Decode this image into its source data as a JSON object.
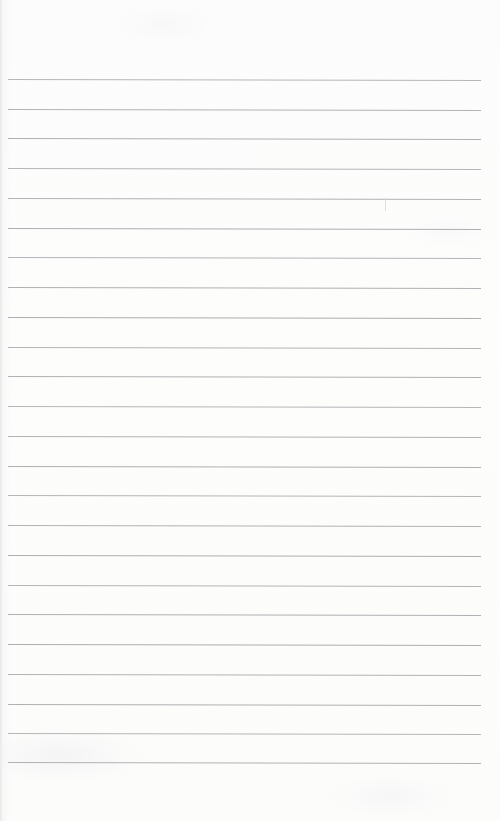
{
  "document": {
    "type": "scanned-lined-paper",
    "title": "Blank lined notepad page",
    "page_width": 500,
    "page_height": 821,
    "background_color": "#fdfdfc",
    "has_text_content": false,
    "text_content": "",
    "ruling": {
      "line_color": "#a9a9ad",
      "line_thickness_px": 1,
      "line_count": 24,
      "first_line_y": 79,
      "line_spacing_px": 29.7,
      "left_x": 8,
      "right_x": 481,
      "slope_deg": 0.12,
      "y_positions": [
        79,
        109,
        138,
        168,
        198,
        228,
        257,
        287,
        317,
        347,
        376,
        406,
        436,
        466,
        495,
        525,
        555,
        585,
        614,
        644,
        674,
        704,
        733,
        762
      ]
    },
    "margins": {
      "top_px": 79,
      "bottom_px": 59,
      "left_px": 8,
      "right_px": 19
    },
    "marks": [
      {
        "name": "pencil-tick",
        "x": 385,
        "y": 198,
        "height": 13,
        "color": "#d9d9dd"
      }
    ]
  }
}
